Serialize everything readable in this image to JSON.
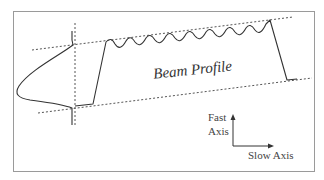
{
  "diagram": {
    "title": "Beam Profile",
    "labels": {
      "beam_profile": "Beam Profile",
      "fast_axis_line1": "Fast",
      "fast_axis_line2": "Axis",
      "slow_axis": "Slow Axis"
    },
    "colors": {
      "frame": "#9a9a9a",
      "line": "#333333",
      "dashed": "#555555",
      "background": "#ffffff"
    }
  }
}
